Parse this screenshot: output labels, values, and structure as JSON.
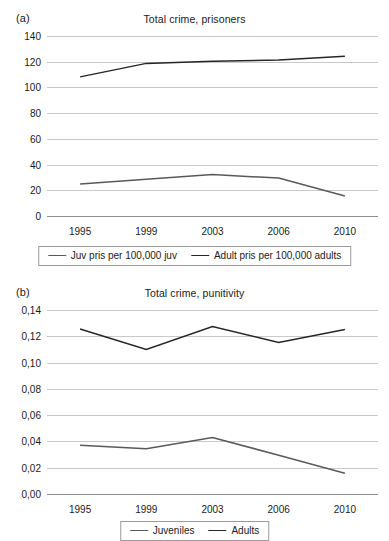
{
  "panels": [
    {
      "key": "a",
      "panel_label": "(a)",
      "title": "Total crime, prisoners"
    },
    {
      "key": "b",
      "panel_label": "(b)",
      "title": "Total crime, punitivity"
    }
  ],
  "colors": {
    "juvenile_line": "#595959",
    "adult_line": "#262626",
    "gridline": "#c9c9c9",
    "axis": "#8f8f8f",
    "text": "#1a1a1a",
    "background": "#ffffff",
    "legend_border": "#9a9a9a"
  },
  "chart_data": [
    {
      "type": "line",
      "panel": "(a)",
      "title": "Total crime, prisoners",
      "xlabel": "",
      "ylabel": "",
      "categories": [
        "1995",
        "1999",
        "2003",
        "2006",
        "2010"
      ],
      "x_ticklabels": [
        "1995",
        "1999",
        "2003",
        "2006",
        "2010"
      ],
      "y_ticklabels": [
        "0",
        "20",
        "40",
        "60",
        "80",
        "100",
        "120",
        "140"
      ],
      "yticks": [
        0,
        20,
        40,
        60,
        80,
        100,
        120,
        140
      ],
      "ylim": [
        0,
        140
      ],
      "grid": true,
      "legend_position": "bottom",
      "series": [
        {
          "name": "Juv pris per 100,000 juv",
          "values": [
            24.8,
            28.6,
            32.2,
            29.5,
            15.6
          ],
          "color": "#595959"
        },
        {
          "name": "Adult pris per 100,000 adults",
          "values": [
            108.2,
            118.7,
            120.3,
            121.4,
            124.3
          ],
          "color": "#262626"
        }
      ]
    },
    {
      "type": "line",
      "panel": "(b)",
      "title": "Total crime, punitivity",
      "xlabel": "",
      "ylabel": "",
      "categories": [
        "1995",
        "1999",
        "2003",
        "2006",
        "2010"
      ],
      "x_ticklabels": [
        "1995",
        "1999",
        "2003",
        "2006",
        "2010"
      ],
      "y_ticklabels": [
        "0,00",
        "0,02",
        "0,04",
        "0,06",
        "0,08",
        "0,10",
        "0,12",
        "0,14"
      ],
      "yticks": [
        0,
        0.02,
        0.04,
        0.06,
        0.08,
        0.1,
        0.12,
        0.14
      ],
      "ylim": [
        0,
        0.14
      ],
      "grid": true,
      "legend_position": "bottom",
      "series": [
        {
          "name": "Juveniles",
          "values": [
            0.037,
            0.0345,
            0.043,
            0.0295,
            0.0158
          ],
          "color": "#595959"
        },
        {
          "name": "Adults",
          "values": [
            0.1255,
            0.11,
            0.1275,
            0.1152,
            0.1252
          ],
          "color": "#262626"
        }
      ]
    }
  ]
}
